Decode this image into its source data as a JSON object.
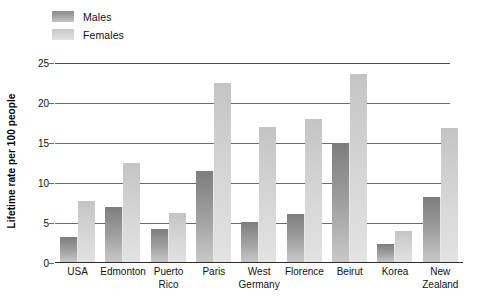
{
  "legend": {
    "position": "top-left",
    "entries": [
      {
        "label": "Males",
        "color": "#8e8e8e",
        "key": "males"
      },
      {
        "label": "Females",
        "color": "#d2d2d2",
        "key": "females"
      }
    ]
  },
  "axes": {
    "ylabel": "Lifetime rate per 100 people",
    "xlabel": "",
    "yticks": [
      0,
      5,
      10,
      15,
      20,
      25
    ],
    "ylim": [
      0,
      25
    ],
    "grid": true
  },
  "chart_data": {
    "type": "bar",
    "title": "",
    "subtitle": "",
    "xlabel": "",
    "ylabel": "Lifetime rate per 100 people",
    "ylim": [
      0,
      25
    ],
    "yticks": [
      0,
      5,
      10,
      15,
      20,
      25
    ],
    "grid": true,
    "legend_position": "top-left",
    "categories": [
      "USA",
      "Edmonton",
      "Puerto Rico",
      "Paris",
      "West Germany",
      "Florence",
      "Beirut",
      "Korea",
      "New Zealand"
    ],
    "category_lines": [
      [
        "USA"
      ],
      [
        "Edmonton"
      ],
      [
        "Puerto",
        "Rico"
      ],
      [
        "Paris"
      ],
      [
        "West",
        "Germany"
      ],
      [
        "Florence"
      ],
      [
        "Beirut"
      ],
      [
        "Korea"
      ],
      [
        "New",
        "Zealand"
      ]
    ],
    "series": [
      {
        "name": "Males",
        "color": "#8e8e8e",
        "values": [
          3.3,
          7.0,
          4.2,
          11.5,
          5.1,
          6.1,
          15.0,
          2.4,
          8.3
        ]
      },
      {
        "name": "Females",
        "color": "#d2d2d2",
        "values": [
          7.8,
          12.5,
          6.2,
          22.5,
          17.0,
          18.0,
          23.6,
          4.0,
          16.9
        ]
      }
    ]
  }
}
